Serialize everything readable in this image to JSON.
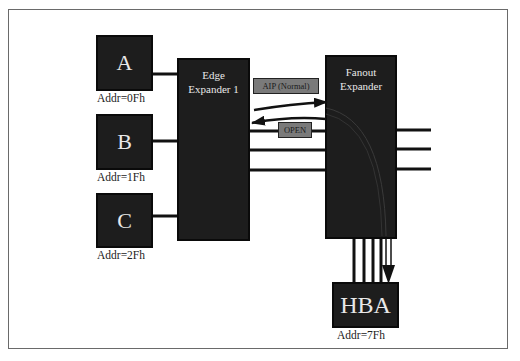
{
  "diagram": {
    "title": "",
    "devices": [
      {
        "id": "A",
        "label": "A",
        "addr": "Addr=0Fh"
      },
      {
        "id": "B",
        "label": "B",
        "addr": "Addr=1Fh"
      },
      {
        "id": "C",
        "label": "C",
        "addr": "Addr=2Fh"
      }
    ],
    "edge_expander": {
      "line1": "Edge",
      "line2": "Expander 1"
    },
    "fanout_expander": {
      "line1": "Fanout",
      "line2": "Expander"
    },
    "hba": {
      "label": "HBA",
      "addr": "Addr=7Fh"
    },
    "signals": {
      "aip": "AIP (Normal)",
      "open": "OPEN"
    },
    "colors": {
      "node_fill": "#1d1d1d",
      "node_text": "#e8e8e8",
      "wire": "#111111",
      "tag_fill": "#7a7a7a",
      "frame_border": "#6a6a6a"
    }
  }
}
